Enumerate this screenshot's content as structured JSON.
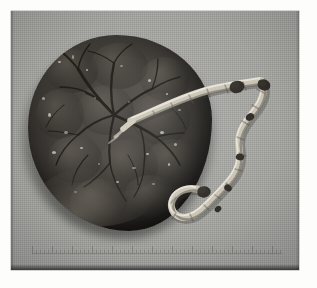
{
  "figure": {
    "domain": "Natural-Image",
    "medium": "monochrome photographic print on gray cloth background",
    "caption": "",
    "colors": {
      "paper": "#fdfdfc",
      "plate_background": "#a2a29f",
      "specimen_dark": "#2b2824",
      "specimen_midtone": "#4e4a45",
      "cord_pale": "#c9c4b4",
      "cord_highlight": "#f0ece1",
      "knot_dark": "#2f2c27",
      "ruler_tick": "#5d5d58"
    }
  },
  "plate": {
    "label": "photographic-plate",
    "x": 11,
    "y": 11,
    "width": 288,
    "height": 259
  },
  "specimen": {
    "placenta": {
      "label": "placenta-disc",
      "surface": "fetal (chorionic) surface",
      "features": [
        "lobulated cotyledon texture",
        "branching chorionic vessel network",
        "glossy amnion highlights",
        "pale membrane rim at lower-left margin"
      ]
    },
    "cord": {
      "label": "umbilical-cord",
      "insertion": "paracentral, left of disc centre",
      "features": [
        "helical coiling",
        "two dark knot-like thickenings at the free end",
        "U-shaped terminal loop at lower right"
      ]
    }
  },
  "scale": {
    "label": "ruler-strip",
    "visible": true,
    "legible_text": "",
    "major_ticks": 13,
    "minor_ticks_per_major": 4
  }
}
